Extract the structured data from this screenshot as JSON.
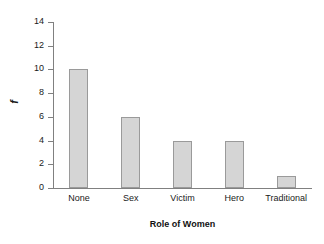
{
  "chart_data": {
    "type": "bar",
    "title": "",
    "xlabel": "Role of Women",
    "ylabel": "f",
    "categories": [
      "None",
      "Sex",
      "Victim",
      "Hero",
      "Traditional"
    ],
    "values": [
      10,
      6,
      4,
      4,
      1
    ],
    "ylim": [
      0,
      14
    ],
    "ytick_labels": [
      "0",
      "2",
      "4",
      "6",
      "8",
      "10",
      "12",
      "14"
    ],
    "ytick_values": [
      0,
      2,
      4,
      6,
      8,
      10,
      12,
      14
    ],
    "grid": false,
    "legend": false,
    "bar_fill_color": "#d5d5d5",
    "bar_edge_color": "#9a9a9a",
    "axis_color": "#808080",
    "text_color": "#1a1a1a"
  }
}
